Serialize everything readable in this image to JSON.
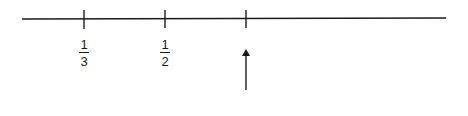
{
  "diagram": {
    "type": "number-line",
    "line": {
      "x1": 22,
      "x2": 446,
      "y": 19,
      "color": "#1a1a1a"
    },
    "ticks": [
      {
        "x": 84,
        "label_num": "1",
        "label_den": "3"
      },
      {
        "x": 165,
        "label_num": "1",
        "label_den": "2"
      },
      {
        "x": 246,
        "label_num": null,
        "label_den": null
      }
    ],
    "arrow": {
      "x": 246,
      "y_tail": 90,
      "y_head": 49,
      "direction": "up",
      "points_to_tick": 2
    }
  }
}
